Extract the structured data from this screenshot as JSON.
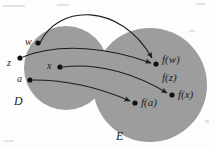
{
  "figure": {
    "background_color": "#fdfdfd",
    "stroke_color": "#1c1c1c"
  },
  "sets": [
    {
      "id": "domain",
      "label": "D",
      "label_x": 14,
      "label_y": 95,
      "cx": 66,
      "cy": 68,
      "r": 42,
      "fill": "#9d9d9d"
    },
    {
      "id": "codomain",
      "label": "E",
      "label_x": 116,
      "label_y": 130,
      "cx": 150,
      "cy": 85,
      "r": 57,
      "fill": "#9d9d9d"
    }
  ],
  "domain_points": [
    {
      "label": "w",
      "x": 38,
      "y": 43,
      "label_x": 25,
      "label_y": 37
    },
    {
      "label": "z",
      "x": 20,
      "y": 58,
      "label_x": 7,
      "label_y": 58
    },
    {
      "label": "x",
      "x": 60,
      "y": 67,
      "label_x": 47,
      "label_y": 61
    },
    {
      "label": "a",
      "x": 30,
      "y": 80,
      "label_x": 17,
      "label_y": 74
    }
  ],
  "codomain_points": [
    {
      "id": "fw-fz",
      "x": 156,
      "y": 64
    },
    {
      "id": "fx",
      "x": 172,
      "y": 95
    },
    {
      "id": "fa",
      "x": 135,
      "y": 103
    }
  ],
  "image_labels": [
    {
      "text": "f(w)",
      "x": 162,
      "y": 54
    },
    {
      "text": "f(z)",
      "x": 162,
      "y": 72
    },
    {
      "text": "f(x)",
      "x": 178,
      "y": 89
    },
    {
      "text": "f(a)",
      "x": 141,
      "y": 97
    }
  ],
  "arrows": [
    {
      "id": "w-to-fw",
      "from": "w",
      "to": "fw-fz",
      "path": "M 40 43 C 58 4, 120 2, 152 58",
      "description": "long arc over the top from w to f(w)"
    },
    {
      "id": "z-to-fz",
      "from": "z",
      "to": "fw-fz",
      "path": "M 23 57 C 60 42, 110 48, 151 63",
      "description": "curve from z to the same image point as w"
    },
    {
      "id": "x-to-fx",
      "from": "x",
      "to": "fx",
      "path": "M 63 67 C 100 62, 140 76, 167 93",
      "description": "curve from x to f(x)"
    },
    {
      "id": "a-to-fa",
      "from": "a",
      "to": "fa",
      "path": "M 33 80 C 70 80, 105 90, 130 101",
      "description": "curve from a to f(a)"
    }
  ],
  "specks": [
    {
      "x": 3,
      "y": 5,
      "w": 22,
      "h": 2
    },
    {
      "x": 57,
      "y": 4,
      "w": 12,
      "h": 2
    },
    {
      "x": 196,
      "y": 3,
      "w": 9,
      "h": 2
    },
    {
      "x": 189,
      "y": 30,
      "w": 6,
      "h": 2
    },
    {
      "x": 4,
      "y": 140,
      "w": 10,
      "h": 2
    },
    {
      "x": 205,
      "y": 120,
      "w": 4,
      "h": 3
    }
  ]
}
